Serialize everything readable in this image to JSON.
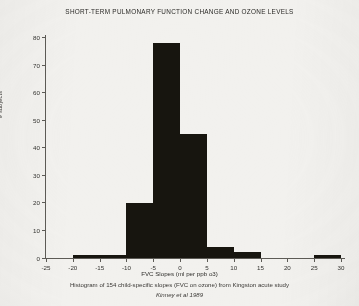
{
  "figure": {
    "title": "SHORT-TERM PULMONARY FUNCTION CHANGE AND OZONE LEVELS",
    "caption_line1": "Histogram of 154 child-specific slopes (FVC on ozone) from Kingston acute study",
    "caption_line2": "Kinney et al 1989",
    "bar_color": "#17150f",
    "axis_color": "#5d5b56",
    "background": "#f2f1ee"
  },
  "chart_data": {
    "type": "bar",
    "title": "SHORT-TERM PULMONARY FUNCTION CHANGE AND OZONE LEVELS",
    "subtitle": "Histogram of 154 child-specific slopes (FVC on ozone) from Kingston acute study",
    "annotation": "Kinney et al 1989",
    "xlabel": "FVC Slopes (ml per ppb o3)",
    "ylabel": "# subjects",
    "xlim": [
      -25,
      30
    ],
    "ylim": [
      0,
      80
    ],
    "grid": false,
    "legend": false,
    "bin_width": 5,
    "n_total": 154,
    "xticks": [
      "-25",
      "-20",
      "-15",
      "-10",
      "-5",
      "0",
      "5",
      "10",
      "15",
      "20",
      "25",
      "30"
    ],
    "xtick_values": [
      -25,
      -20,
      -15,
      -10,
      -5,
      0,
      5,
      10,
      15,
      20,
      25,
      30
    ],
    "yticks": [
      "0",
      "10",
      "20",
      "30",
      "40",
      "50",
      "60",
      "70",
      "80"
    ],
    "ytick_values": [
      0,
      10,
      20,
      30,
      40,
      50,
      60,
      70,
      80
    ],
    "categories": [
      "-25 to -20",
      "-20 to -15",
      "-15 to -10",
      "-10 to -5",
      "-5 to 0",
      "0 to 5",
      "5 to 10",
      "10 to 15",
      "15 to 20",
      "20 to 25",
      "25 to 30"
    ],
    "bin_starts": [
      -25,
      -20,
      -15,
      -10,
      -5,
      0,
      5,
      10,
      15,
      20,
      25
    ],
    "values": [
      0,
      1,
      1,
      20,
      78,
      45,
      4,
      2,
      0,
      0,
      1
    ]
  }
}
